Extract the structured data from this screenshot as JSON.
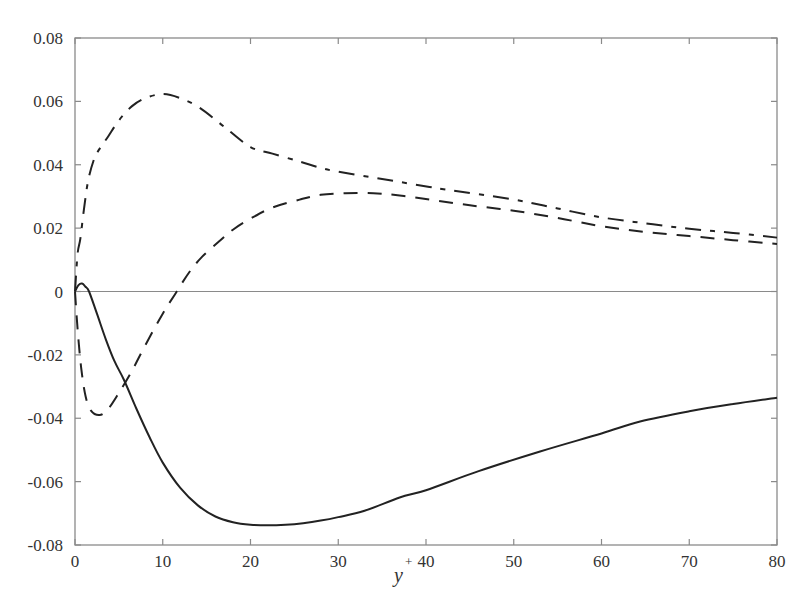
{
  "chart_data": {
    "type": "line",
    "title": "",
    "xlabel": "y",
    "xlabel_superscript": "+",
    "ylabel": "",
    "xlim": [
      0,
      80
    ],
    "ylim": [
      -0.08,
      0.08
    ],
    "xticks": [
      0,
      10,
      20,
      30,
      40,
      50,
      60,
      70,
      80
    ],
    "xtick_labels": [
      "0",
      "10",
      "20",
      "30",
      "40",
      "50",
      "60",
      "70",
      "80"
    ],
    "yticks": [
      -0.08,
      -0.06,
      -0.04,
      -0.02,
      0,
      0.02,
      0.04,
      0.06,
      0.08
    ],
    "ytick_labels": [
      "-0.08",
      "-0.06",
      "-0.04",
      "-0.02",
      "0",
      "0.02",
      "0.04",
      "0.06",
      "0.08"
    ],
    "grid": false,
    "legend": "none",
    "zero_line": true,
    "series": [
      {
        "name": "solid",
        "style": "solid",
        "color": "#222222",
        "x": [
          0,
          0.4,
          0.8,
          1.2,
          1.6,
          2.5,
          3.5,
          4.5,
          5.6,
          7,
          8.5,
          10,
          12,
          14,
          16,
          18,
          20,
          22,
          24,
          26,
          28,
          30,
          33,
          37,
          40,
          46,
          53,
          60,
          64.4,
          70,
          75,
          80
        ],
        "y": [
          0,
          0.002,
          0.0025,
          0.0015,
          0,
          -0.007,
          -0.015,
          -0.022,
          -0.028,
          -0.037,
          -0.046,
          -0.054,
          -0.062,
          -0.0675,
          -0.071,
          -0.0728,
          -0.0736,
          -0.0738,
          -0.0736,
          -0.0731,
          -0.0723,
          -0.0712,
          -0.0692,
          -0.065,
          -0.0627,
          -0.0567,
          -0.0505,
          -0.0448,
          -0.041,
          -0.0378,
          -0.0355,
          -0.0335
        ]
      },
      {
        "name": "dashed",
        "style": "dashed",
        "color": "#222222",
        "x": [
          0,
          0.3,
          0.7,
          1.2,
          1.8,
          2.8,
          3.8,
          5,
          6.5,
          8,
          10,
          11.6,
          13,
          14.5,
          16.5,
          18,
          20,
          22.5,
          25.6,
          28,
          30.8,
          34,
          37,
          40.4,
          45,
          50,
          55,
          60,
          65,
          70,
          75,
          80
        ],
        "y": [
          0,
          -0.012,
          -0.024,
          -0.033,
          -0.0375,
          -0.039,
          -0.037,
          -0.032,
          -0.025,
          -0.017,
          -0.007,
          0,
          0.006,
          0.011,
          0.016,
          0.0195,
          0.023,
          0.0265,
          0.029,
          0.0305,
          0.031,
          0.031,
          0.0303,
          0.029,
          0.0272,
          0.0255,
          0.0232,
          0.0206,
          0.0188,
          0.0175,
          0.0162,
          0.015
        ]
      },
      {
        "name": "dash-dot",
        "style": "dashdot",
        "color": "#222222",
        "x": [
          0,
          0.3,
          0.6,
          1,
          1.5,
          2.2,
          2.8,
          3.8,
          5,
          6.5,
          8,
          10,
          12,
          14.2,
          17,
          20,
          22.5,
          25.6,
          28,
          30,
          35,
          40.4,
          42.7,
          50,
          55,
          60,
          65,
          70,
          75,
          80
        ],
        "y": [
          0,
          0.012,
          0.0165,
          0.0255,
          0.035,
          0.042,
          0.045,
          0.049,
          0.054,
          0.0585,
          0.061,
          0.0623,
          0.061,
          0.058,
          0.052,
          0.0456,
          0.0435,
          0.041,
          0.039,
          0.0378,
          0.0355,
          0.033,
          0.032,
          0.029,
          0.0262,
          0.0234,
          0.0215,
          0.0198,
          0.0185,
          0.017
        ]
      }
    ]
  }
}
